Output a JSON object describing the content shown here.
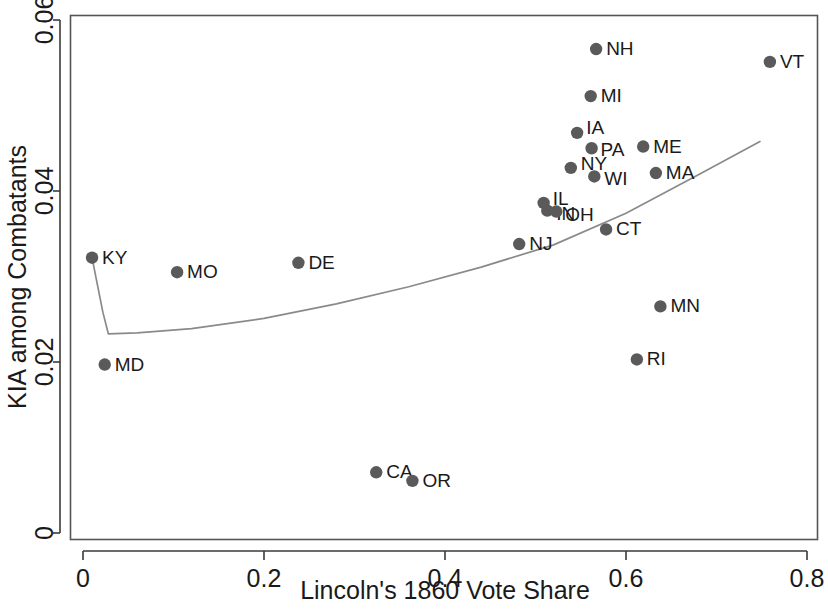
{
  "chart_data": {
    "type": "scatter",
    "title": "",
    "xlabel": "Lincoln's 1860 Vote Share",
    "ylabel": "KIA among Combatants",
    "xlim": [
      -0.015,
      0.812
    ],
    "ylim": [
      -0.0008,
      0.0605
    ],
    "grid": false,
    "legend": "none",
    "xticks": [
      0,
      0.2,
      0.4,
      0.6,
      0.8
    ],
    "xticklabels": [
      "0",
      "0.2",
      "0.4",
      "0.6",
      "0.8"
    ],
    "yticks": [
      0,
      0.02,
      0.04,
      0.06
    ],
    "yticklabels": [
      "0",
      "0.02",
      "0.04",
      "0.06"
    ],
    "marker_color": "#5a5a5a",
    "line_color": "#8a8a8a",
    "points": [
      {
        "label": "KY",
        "x": 0.01,
        "y": 0.0322,
        "lx": 10,
        "ly": 6
      },
      {
        "label": "MD",
        "x": 0.024,
        "y": 0.0197,
        "lx": 10,
        "ly": 6
      },
      {
        "label": "MO",
        "x": 0.104,
        "y": 0.0305,
        "lx": 10,
        "ly": 6
      },
      {
        "label": "DE",
        "x": 0.238,
        "y": 0.0316,
        "lx": 10,
        "ly": 6
      },
      {
        "label": "CA",
        "x": 0.324,
        "y": 0.0071,
        "lx": 10,
        "ly": 6
      },
      {
        "label": "OR",
        "x": 0.364,
        "y": 0.0061,
        "lx": 10,
        "ly": 6
      },
      {
        "label": "NJ",
        "x": 0.482,
        "y": 0.0338,
        "lx": 10,
        "ly": 6
      },
      {
        "label": "IL",
        "x": 0.509,
        "y": 0.0386,
        "lx": 9,
        "ly": 2
      },
      {
        "label": "IN",
        "x": 0.513,
        "y": 0.0377,
        "lx": 9,
        "ly": 9
      },
      {
        "label": "OH",
        "x": 0.523,
        "y": 0.0376,
        "lx": 9,
        "ly": 9
      },
      {
        "label": "NY",
        "x": 0.539,
        "y": 0.0427,
        "lx": 10,
        "ly": 2
      },
      {
        "label": "IA",
        "x": 0.546,
        "y": 0.0468,
        "lx": 9,
        "ly": 1
      },
      {
        "label": "PA",
        "x": 0.562,
        "y": 0.045,
        "lx": 9,
        "ly": 8
      },
      {
        "label": "MI",
        "x": 0.561,
        "y": 0.0511,
        "lx": 10,
        "ly": 6
      },
      {
        "label": "NH",
        "x": 0.567,
        "y": 0.0566,
        "lx": 10,
        "ly": 6
      },
      {
        "label": "WI",
        "x": 0.565,
        "y": 0.0417,
        "lx": 10,
        "ly": 9
      },
      {
        "label": "CT",
        "x": 0.578,
        "y": 0.0355,
        "lx": 10,
        "ly": 6
      },
      {
        "label": "RI",
        "x": 0.612,
        "y": 0.0203,
        "lx": 10,
        "ly": 6
      },
      {
        "label": "ME",
        "x": 0.619,
        "y": 0.0452,
        "lx": 10,
        "ly": 6
      },
      {
        "label": "MA",
        "x": 0.633,
        "y": 0.0421,
        "lx": 10,
        "ly": 6
      },
      {
        "label": "MN",
        "x": 0.638,
        "y": 0.0265,
        "lx": 10,
        "ly": 6
      },
      {
        "label": "VT",
        "x": 0.759,
        "y": 0.0551,
        "lx": 10,
        "ly": 6
      }
    ],
    "fit_line": [
      {
        "x": 0.01,
        "y": 0.0322
      },
      {
        "x": 0.016,
        "y": 0.029
      },
      {
        "x": 0.022,
        "y": 0.0258
      },
      {
        "x": 0.028,
        "y": 0.0233
      },
      {
        "x": 0.06,
        "y": 0.0234
      },
      {
        "x": 0.12,
        "y": 0.0239
      },
      {
        "x": 0.2,
        "y": 0.0251
      },
      {
        "x": 0.28,
        "y": 0.0268
      },
      {
        "x": 0.36,
        "y": 0.0288
      },
      {
        "x": 0.44,
        "y": 0.0311
      },
      {
        "x": 0.52,
        "y": 0.0337
      },
      {
        "x": 0.6,
        "y": 0.0374
      },
      {
        "x": 0.68,
        "y": 0.0419
      },
      {
        "x": 0.748,
        "y": 0.0458
      }
    ]
  }
}
